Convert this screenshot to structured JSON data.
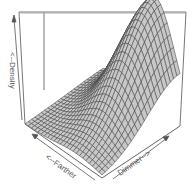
{
  "chart_data": {
    "type": "surface3d",
    "title": "",
    "axes": {
      "z_label": "<--Density",
      "x_label": "<--Farther",
      "y_label": "Dimmer-->"
    },
    "surface": {
      "description": "Bivariate density surface rising from near-zero in the Farther direction to a single peak toward the Dimmer/back corner",
      "grid_rows": 24,
      "grid_cols": 24,
      "peak_location": "back-right, near max Dimmer",
      "peak_relative_height": 1.0,
      "baseline_relative_height": 0.0
    },
    "ticks": "none",
    "box": true,
    "colors": {
      "surface_fill": "#c8c8c8",
      "mesh_line": "#444444",
      "box_line": "#666666",
      "label_text": "#555555"
    }
  },
  "labels": {
    "density": "<--Density",
    "farther": "<--Farther",
    "dimmer": "Dimmer-->"
  }
}
